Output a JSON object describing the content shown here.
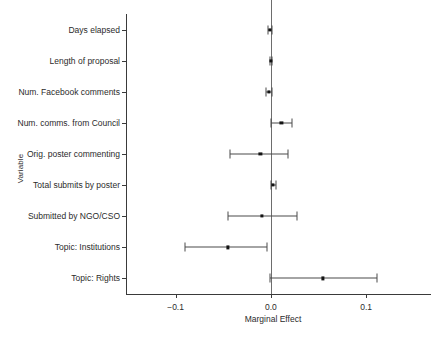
{
  "chart_data": {
    "type": "scatter",
    "title": "",
    "subtitle": "",
    "xlabel": "Marginal Effect",
    "ylabel": "Variable",
    "orientation": "horizontal",
    "grid": false,
    "legend": "none",
    "xlim": [
      -0.152,
      0.168
    ],
    "xticks": [
      -0.1,
      0.0,
      0.1
    ],
    "xticklabels": [
      "−0.1",
      "0.0",
      "0.1"
    ],
    "reference_line": 0.0,
    "annotations": [],
    "categories": [
      "Days elapsed",
      "Length of proposal",
      "Num. Facebook comments",
      "Num. comms. from Council",
      "Orig. poster commenting",
      "Total submits by poster",
      "Submitted by NGO/CSO",
      "Topic: Institutions",
      "Topic: Rights"
    ],
    "series": [
      {
        "name": "Marginal Effect",
        "values": [
          -0.001,
          0.0,
          -0.002,
          0.011,
          -0.011,
          0.002,
          -0.009,
          -0.045,
          0.055
        ],
        "ci_low": [
          -0.003,
          -0.001,
          -0.005,
          0.0,
          -0.043,
          0.0,
          -0.045,
          -0.09,
          -0.001
        ],
        "ci_high": [
          0.001,
          0.001,
          0.001,
          0.022,
          0.018,
          0.005,
          0.027,
          -0.004,
          0.111
        ]
      }
    ]
  },
  "colors": {
    "point": "#141414",
    "interval": "#4a4a4a",
    "axis": "#3a3a3a",
    "reference": "#6d6d6d",
    "background": "#ffffff",
    "text": "#2b2b2b"
  }
}
